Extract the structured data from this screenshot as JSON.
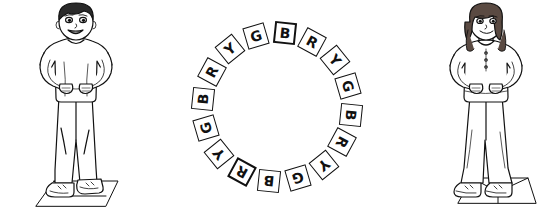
{
  "scene": {
    "title": "Letter Circle Activity",
    "description": "Line drawing of a boy and a girl standing with hands on hips on either side of a ring of lettered tiles",
    "background_color": "#ffffff",
    "ink_color": "#111111",
    "width": 554,
    "height": 215
  },
  "figures": [
    {
      "id": "boy",
      "name": "boy-figure",
      "label": "Boy standing with hands on hips",
      "hair": "short dark hair",
      "expression": "smiling",
      "pose": "hands on hips",
      "clothing": "short sleeve shirt and long pants",
      "footwear": "sneakers",
      "standing_on": "mat"
    },
    {
      "id": "girl",
      "name": "girl-figure",
      "label": "Girl standing with hands on hips",
      "hair": "long hair",
      "expression": "smiling",
      "pose": "hands on hips",
      "clothing": "short sleeve top and long pants",
      "footwear": "sneakers",
      "standing_on": "mat"
    }
  ],
  "letter_ring": {
    "name": "letter-ring",
    "count": 16,
    "pattern": [
      "B",
      "R",
      "Y",
      "G"
    ],
    "start_angle_deg": -84,
    "radius": 74,
    "center": {
      "x": 92,
      "y": 105
    },
    "tiles": [
      {
        "letter": "B",
        "angle": -84,
        "accent": true
      },
      {
        "letter": "R",
        "angle": -61.5,
        "accent": false
      },
      {
        "letter": "Y",
        "angle": -39,
        "accent": false
      },
      {
        "letter": "G",
        "angle": -16.5,
        "accent": false
      },
      {
        "letter": "B",
        "angle": 6,
        "accent": false
      },
      {
        "letter": "R",
        "angle": 28.5,
        "accent": false
      },
      {
        "letter": "Y",
        "angle": 51,
        "accent": false
      },
      {
        "letter": "G",
        "angle": 73.5,
        "accent": false
      },
      {
        "letter": "B",
        "angle": 96,
        "accent": false
      },
      {
        "letter": "R",
        "angle": 118.5,
        "accent": true
      },
      {
        "letter": "Y",
        "angle": 141,
        "accent": false
      },
      {
        "letter": "G",
        "angle": 163.5,
        "accent": false
      },
      {
        "letter": "B",
        "angle": 186,
        "accent": false
      },
      {
        "letter": "R",
        "angle": 208.5,
        "accent": false
      },
      {
        "letter": "Y",
        "angle": 231,
        "accent": false
      },
      {
        "letter": "G",
        "angle": 253.5,
        "accent": false
      }
    ]
  }
}
